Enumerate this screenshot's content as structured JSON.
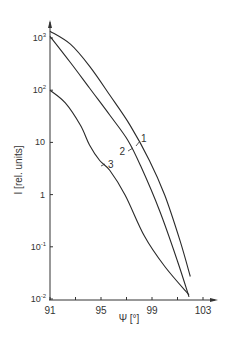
{
  "chart_data": {
    "type": "line",
    "title": "",
    "xlabel": "Ψ [°]",
    "ylabel": "I [rel. units]",
    "xscale": "linear",
    "yscale": "log",
    "xlim": [
      91,
      104
    ],
    "ylim": [
      0.01,
      2000
    ],
    "x_ticks": [
      91,
      95,
      99,
      103
    ],
    "x_tick_labels": [
      "91",
      "95",
      "99",
      "103"
    ],
    "y_ticks": [
      0.01,
      0.1,
      1,
      10,
      100,
      1000
    ],
    "y_tick_labels": [
      {
        "base": "10",
        "exp": "-2"
      },
      {
        "base": "10",
        "exp": "-1"
      },
      {
        "base": "1",
        "exp": ""
      },
      {
        "base": "10",
        "exp": ""
      },
      {
        "base": "10",
        "exp": "2"
      },
      {
        "base": "10",
        "exp": "3"
      }
    ],
    "grid": false,
    "legend": "inline curve labels",
    "series": [
      {
        "name": "1",
        "x": [
          91,
          92.6,
          94.1,
          95.7,
          97.3,
          98.8,
          100.0,
          101.2,
          102.0
        ],
        "y": [
          1350,
          760,
          290,
          80,
          21,
          4.5,
          0.97,
          0.13,
          0.027
        ]
      },
      {
        "name": "2",
        "x": [
          91,
          92.6,
          94.1,
          95.7,
          97.1,
          98.1,
          99.6,
          101.0,
          101.9
        ],
        "y": [
          1080,
          340,
          110,
          33,
          11,
          3.6,
          0.49,
          0.053,
          0.011
        ]
      },
      {
        "name": "3",
        "x": [
          91,
          92.2,
          93.4,
          94.1,
          94.9,
          95.7,
          96.9,
          98.4,
          100.0,
          101.9
        ],
        "y": [
          100,
          57,
          21,
          8.9,
          4.5,
          2.9,
          0.97,
          0.16,
          0.042,
          0.012
        ]
      }
    ],
    "annotations": [
      {
        "text": "1",
        "curve": "1",
        "x": 98.4,
        "y": 7.5
      },
      {
        "text": "2",
        "curve": "2",
        "x": 96.8,
        "y": 5
      },
      {
        "text": "3",
        "curve": "3",
        "x": 95.2,
        "y": 3.2
      }
    ]
  }
}
